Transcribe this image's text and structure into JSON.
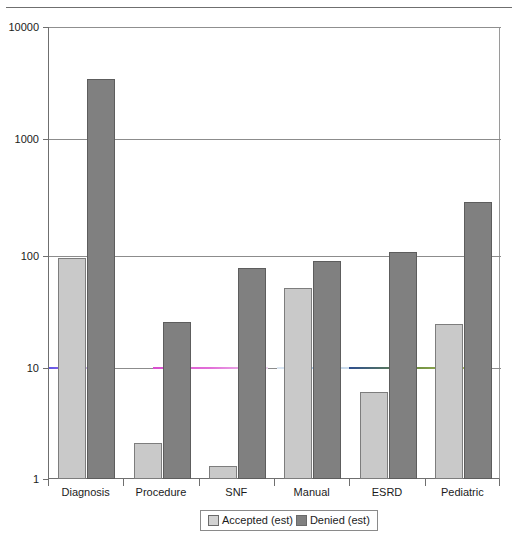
{
  "chart_data": {
    "type": "bar",
    "title": "",
    "xlabel": "",
    "ylabel": "",
    "yscale": "log",
    "ylim": [
      1,
      10000
    ],
    "ytick_labels": [
      "1",
      "10",
      "100",
      "1000",
      "10000"
    ],
    "ytick_values": [
      1,
      10,
      100,
      1000,
      10000
    ],
    "grid": true,
    "legend_position": "bottom-center",
    "categories": [
      "Diagnosis",
      "Procedure",
      "SNF",
      "Manual",
      "ESRD",
      "Pediatric"
    ],
    "series": [
      {
        "name": "Accepted (est)",
        "color": "#c9c9c9",
        "values": [
          95,
          2.1,
          1.3,
          51,
          6,
          24
        ]
      },
      {
        "name": "Denied (est)",
        "color": "#808080",
        "values": [
          3700,
          25,
          76,
          89,
          107,
          300
        ]
      }
    ]
  },
  "axis": {
    "y_ticks": [
      {
        "label": "10000",
        "top": 27
      },
      {
        "label": "1000",
        "top": 139
      },
      {
        "label": "100",
        "top": 256
      },
      {
        "label": "10",
        "top": 368
      },
      {
        "label": "1",
        "top": 479
      }
    ]
  },
  "legend": {
    "items": [
      {
        "label": "Accepted (est)",
        "swatch": "accepted"
      },
      {
        "label": "Denied (est)",
        "swatch": "denied"
      }
    ]
  }
}
